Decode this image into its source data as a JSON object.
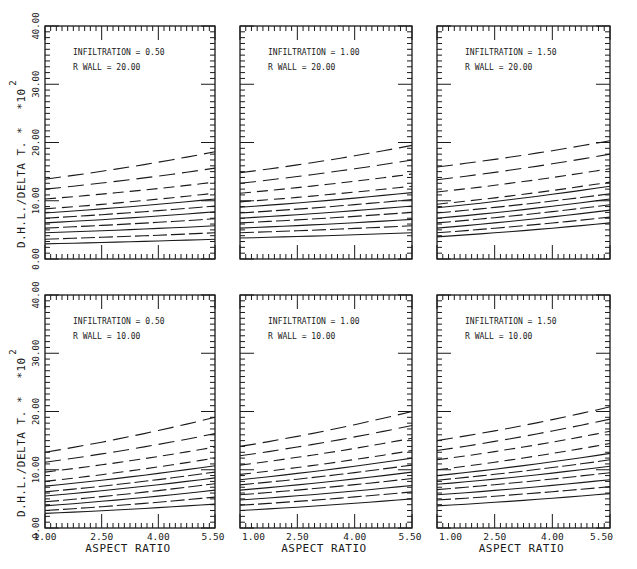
{
  "chart_data": {
    "type": "line",
    "title": "",
    "xlabel": "ASPECT RATIO",
    "ylabel": "D.H.L./DELTA T. *",
    "ylabel_multiplier": "*10",
    "ylabel_exponent": "2",
    "xlim": [
      1.0,
      5.5
    ],
    "ylim": [
      0.0,
      40.0
    ],
    "x_ticks": [
      "1.00",
      "2.50",
      "4.00",
      "5.50"
    ],
    "x_tick_values": [
      1.0,
      2.5,
      4.0,
      5.5
    ],
    "y_ticks": [
      "0.00",
      "10.00",
      "20.00",
      "30.00",
      "40.00"
    ],
    "y_tick_values": [
      0,
      10,
      20,
      30,
      40
    ],
    "grid": false,
    "curve_styles": [
      "long-dash",
      "long-dash",
      "medium-dash",
      "medium-dash",
      "solid",
      "heavy-dash",
      "solid",
      "heavy-dash",
      "solid",
      "heavy-dash",
      "solid"
    ],
    "panels": [
      {
        "row": 1,
        "col": 1,
        "annotation_line1": "INFILTRATION = 0.50",
        "annotation_line2": "R WALL = 20.00",
        "x": [
          1.0,
          5.5
        ],
        "series": [
          {
            "name": "curve-1",
            "values": [
              13.7,
              18.4
            ]
          },
          {
            "name": "curve-2",
            "values": [
              12.0,
              15.6
            ]
          },
          {
            "name": "curve-3",
            "values": [
              10.3,
              13.2
            ]
          },
          {
            "name": "curve-4",
            "values": [
              8.6,
              11.3
            ]
          },
          {
            "name": "curve-5",
            "values": [
              7.9,
              10.3
            ]
          },
          {
            "name": "curve-6",
            "values": [
              7.0,
              9.1
            ]
          },
          {
            "name": "curve-7",
            "values": [
              6.2,
              8.1
            ]
          },
          {
            "name": "curve-8",
            "values": [
              5.3,
              6.9
            ]
          },
          {
            "name": "curve-9",
            "values": [
              4.5,
              5.7
            ]
          },
          {
            "name": "curve-10",
            "values": [
              3.4,
              4.5
            ]
          },
          {
            "name": "curve-11",
            "values": [
              2.6,
              3.4
            ]
          }
        ]
      },
      {
        "row": 1,
        "col": 2,
        "annotation_line1": "INFILTRATION = 1.00",
        "annotation_line2": "R WALL = 20.00",
        "x": [
          1.0,
          5.5
        ],
        "series": [
          {
            "name": "curve-1",
            "values": [
              14.8,
              19.5
            ]
          },
          {
            "name": "curve-2",
            "values": [
              13.0,
              17.0
            ]
          },
          {
            "name": "curve-3",
            "values": [
              11.3,
              14.6
            ]
          },
          {
            "name": "curve-4",
            "values": [
              9.8,
              12.5
            ]
          },
          {
            "name": "curve-5",
            "values": [
              8.9,
              11.4
            ]
          },
          {
            "name": "curve-6",
            "values": [
              7.9,
              10.2
            ]
          },
          {
            "name": "curve-7",
            "values": [
              7.0,
              9.1
            ]
          },
          {
            "name": "curve-8",
            "values": [
              6.2,
              8.0
            ]
          },
          {
            "name": "curve-9",
            "values": [
              5.3,
              6.8
            ]
          },
          {
            "name": "curve-10",
            "values": [
              4.5,
              5.7
            ]
          },
          {
            "name": "curve-11",
            "values": [
              3.6,
              4.5
            ]
          }
        ]
      },
      {
        "row": 1,
        "col": 3,
        "annotation_line1": "INFILTRATION = 1.50",
        "annotation_line2": "R WALL = 20.00",
        "x": [
          1.0,
          5.5
        ],
        "series": [
          {
            "name": "curve-1",
            "values": [
              15.8,
              20.3
            ]
          },
          {
            "name": "curve-2",
            "values": [
              13.6,
              18.0
            ]
          },
          {
            "name": "curve-3",
            "values": [
              11.5,
              15.5
            ]
          },
          {
            "name": "curve-4",
            "values": [
              9.4,
              13.2
            ]
          },
          {
            "name": "curve-5",
            "values": [
              8.8,
              12.5
            ]
          },
          {
            "name": "curve-6",
            "values": [
              7.9,
              11.2
            ]
          },
          {
            "name": "curve-7",
            "values": [
              7.0,
              10.3
            ]
          },
          {
            "name": "curve-8",
            "values": [
              6.2,
              9.3
            ]
          },
          {
            "name": "curve-9",
            "values": [
              5.3,
              8.4
            ]
          },
          {
            "name": "curve-10",
            "values": [
              4.5,
              7.2
            ]
          },
          {
            "name": "curve-11",
            "values": [
              3.8,
              6.2
            ]
          }
        ]
      },
      {
        "row": 2,
        "col": 1,
        "annotation_line1": "INFILTRATION = 0.50",
        "annotation_line2": "R WALL = 10.00",
        "x": [
          1.0,
          5.5
        ],
        "series": [
          {
            "name": "curve-1",
            "values": [
              13.0,
              19.0
            ]
          },
          {
            "name": "curve-2",
            "values": [
              11.3,
              16.2
            ]
          },
          {
            "name": "curve-3",
            "values": [
              9.6,
              13.9
            ]
          },
          {
            "name": "curve-4",
            "values": [
              8.0,
              12.0
            ]
          },
          {
            "name": "curve-5",
            "values": [
              7.2,
              10.7
            ]
          },
          {
            "name": "curve-6",
            "values": [
              6.2,
              9.6
            ]
          },
          {
            "name": "curve-7",
            "values": [
              5.5,
              8.6
            ]
          },
          {
            "name": "curve-8",
            "values": [
              4.5,
              7.6
            ]
          },
          {
            "name": "curve-9",
            "values": [
              3.8,
              6.5
            ]
          },
          {
            "name": "curve-10",
            "values": [
              3.0,
              5.3
            ]
          },
          {
            "name": "curve-11",
            "values": [
              2.5,
              4.1
            ]
          }
        ]
      },
      {
        "row": 2,
        "col": 2,
        "annotation_line1": "INFILTRATION = 1.00",
        "annotation_line2": "R WALL = 10.00",
        "x": [
          1.0,
          5.5
        ],
        "series": [
          {
            "name": "curve-1",
            "values": [
              14.0,
              20.0
            ]
          },
          {
            "name": "curve-2",
            "values": [
              12.4,
              17.6
            ]
          },
          {
            "name": "curve-3",
            "values": [
              10.8,
              15.4
            ]
          },
          {
            "name": "curve-4",
            "values": [
              9.2,
              13.3
            ]
          },
          {
            "name": "curve-5",
            "values": [
              8.3,
              12.0
            ]
          },
          {
            "name": "curve-6",
            "values": [
              7.4,
              10.8
            ]
          },
          {
            "name": "curve-7",
            "values": [
              6.5,
              9.6
            ]
          },
          {
            "name": "curve-8",
            "values": [
              5.7,
              8.5
            ]
          },
          {
            "name": "curve-9",
            "values": [
              4.8,
              7.3
            ]
          },
          {
            "name": "curve-10",
            "values": [
              3.9,
              6.2
            ]
          },
          {
            "name": "curve-11",
            "values": [
              3.0,
              5.0
            ]
          }
        ]
      },
      {
        "row": 2,
        "col": 3,
        "annotation_line1": "INFILTRATION = 1.50",
        "annotation_line2": "R WALL = 10.00",
        "x": [
          1.0,
          5.5
        ],
        "series": [
          {
            "name": "curve-1",
            "values": [
              15.0,
              20.8
            ]
          },
          {
            "name": "curve-2",
            "values": [
              13.3,
              18.7
            ]
          },
          {
            "name": "curve-3",
            "values": [
              11.7,
              16.6
            ]
          },
          {
            "name": "curve-4",
            "values": [
              10.0,
              14.5
            ]
          },
          {
            "name": "curve-5",
            "values": [
              9.0,
              12.8
            ]
          },
          {
            "name": "curve-6",
            "values": [
              8.2,
              11.7
            ]
          },
          {
            "name": "curve-7",
            "values": [
              7.5,
              10.6
            ]
          },
          {
            "name": "curve-8",
            "values": [
              6.6,
              9.5
            ]
          },
          {
            "name": "curve-9",
            "values": [
              5.7,
              8.3
            ]
          },
          {
            "name": "curve-10",
            "values": [
              4.8,
              7.1
            ]
          },
          {
            "name": "curve-11",
            "values": [
              3.8,
              5.9
            ]
          }
        ]
      }
    ]
  }
}
